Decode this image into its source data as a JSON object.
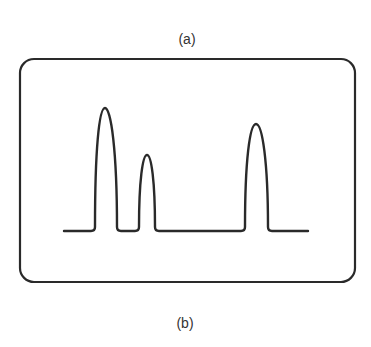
{
  "figure": {
    "top_caption_fragment": "…",
    "panel_a_label": "(a)",
    "panel_b_label": "(b)",
    "frame": {
      "x": 20,
      "y": 59,
      "width": 335,
      "height": 223,
      "radius": 14,
      "stroke": "#2a2a2a"
    },
    "trace": {
      "stroke": "#2a2a2a",
      "baseline_y": 231,
      "x_start": 64,
      "x_end": 308,
      "peaks": [
        {
          "name": "peak-1",
          "apex_x": 105,
          "apex_y": 108,
          "left_x": 95,
          "right_x": 117
        },
        {
          "name": "peak-2",
          "apex_x": 147,
          "apex_y": 155,
          "left_x": 139,
          "right_x": 155
        },
        {
          "name": "peak-3",
          "apex_x": 256,
          "apex_y": 124,
          "left_x": 245,
          "right_x": 268
        }
      ]
    }
  }
}
